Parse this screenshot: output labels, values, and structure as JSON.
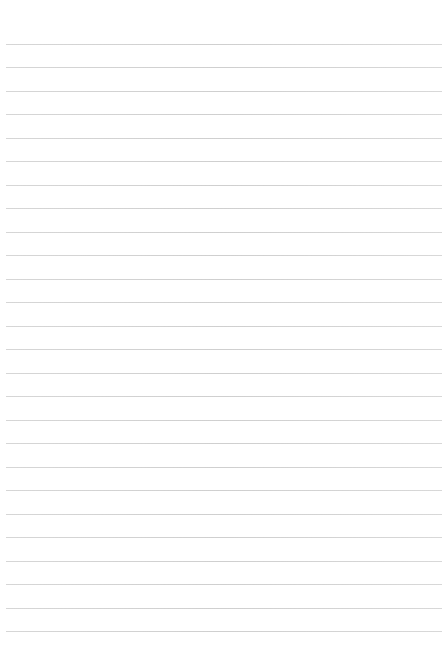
{
  "page": {
    "type": "lined-paper",
    "background": "#ffffff",
    "rule_color": "#d2d2d2",
    "rule_count": 26,
    "first_rule_y": 44,
    "rule_spacing": 23.48,
    "text": ""
  }
}
